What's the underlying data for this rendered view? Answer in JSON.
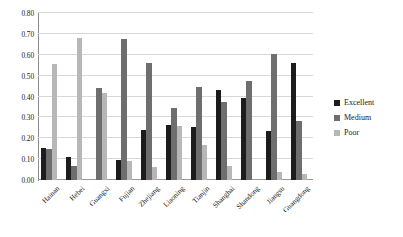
{
  "chart_data": {
    "type": "bar",
    "title": "",
    "subtitle": "",
    "xlabel": "",
    "ylabel": "",
    "ylim": [
      0.0,
      0.8
    ],
    "ytick_labels": [
      "0.80",
      "0.70",
      "0.60",
      "0.50",
      "0.40",
      "0.30",
      "0.20",
      "0.10",
      "0.00"
    ],
    "ytick_values": [
      0.8,
      0.7,
      0.6,
      0.5,
      0.4,
      0.3,
      0.2,
      0.1,
      0.0
    ],
    "grid": true,
    "grid_axis": "y",
    "legend_position": "right",
    "categories": [
      "Hainan",
      "Hebei",
      "Guangxi",
      "Fujian",
      "Zhejiang",
      "Liaoning",
      "Tianjin",
      "Shanghai",
      "Shandong",
      "Jiangsu",
      "Guangdong"
    ],
    "series": [
      {
        "name": "Excellent",
        "color": "#1c1c1c",
        "values": [
          0.155,
          0.11,
          0.0,
          0.097,
          0.24,
          0.262,
          0.253,
          0.433,
          0.395,
          0.234,
          0.562
        ]
      },
      {
        "name": "Medium",
        "color": "#6e6e6e",
        "values": [
          0.148,
          0.068,
          0.443,
          0.677,
          0.56,
          0.345,
          0.447,
          0.374,
          0.475,
          0.602,
          0.285
        ]
      },
      {
        "name": "Poor",
        "color": "#b7b7b7",
        "values": [
          0.556,
          0.682,
          0.418,
          0.09,
          0.063,
          0.258,
          0.168,
          0.065,
          0.0,
          0.039,
          0.03
        ]
      }
    ]
  },
  "legend": {
    "items": [
      {
        "label": "Excellent",
        "color": "#1c1c1c"
      },
      {
        "label": "Medium",
        "color": "#6e6e6e"
      },
      {
        "label": "Poor",
        "color": "#b7b7b7"
      }
    ]
  }
}
